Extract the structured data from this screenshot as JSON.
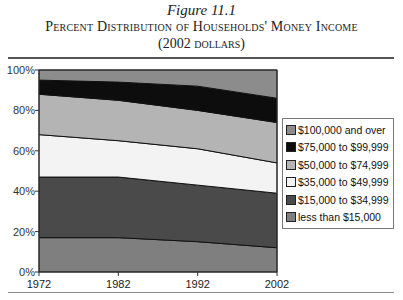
{
  "figure": {
    "number": "Figure 11.1",
    "title": "Percent Distribution of Households' Money Income",
    "subtitle": "(2002 dollars)"
  },
  "chart_data": {
    "type": "area",
    "stacked": true,
    "xlabel": "",
    "ylabel": "",
    "x": [
      1972,
      1982,
      1992,
      2002
    ],
    "x_tick_labels": [
      "1972",
      "1982",
      "1992",
      "2002"
    ],
    "y_tick_labels": [
      "0%",
      "20%",
      "40%",
      "60%",
      "80%",
      "100%"
    ],
    "ylim": [
      0,
      100
    ],
    "grid": false,
    "legend_position": "right",
    "series": [
      {
        "name": "less than $15,000",
        "color": "#7f7f7f",
        "values": [
          17,
          17,
          15,
          12
        ]
      },
      {
        "name": "$15,000 to $34,999",
        "color": "#4a4a4a",
        "values": [
          30,
          30,
          28,
          27
        ]
      },
      {
        "name": "$35,000 to $49,999",
        "color": "#f3f3f3",
        "values": [
          21,
          18,
          18,
          15
        ]
      },
      {
        "name": "$50,000 to $74,999",
        "color": "#b4b4b4",
        "values": [
          20,
          20,
          19,
          20
        ]
      },
      {
        "name": "$75,000 to $99,999",
        "color": "#0d0d0d",
        "values": [
          7,
          9,
          12,
          12
        ]
      },
      {
        "name": "$100,000 and over",
        "color": "#8c8c8c",
        "values": [
          5,
          6,
          8,
          14
        ]
      }
    ]
  },
  "legend": {
    "items": [
      {
        "label": "$100,000 and over",
        "color": "#8c8c8c"
      },
      {
        "label": "$75,000 to $99,999",
        "color": "#0d0d0d"
      },
      {
        "label": "$50,000 to $74,999",
        "color": "#b4b4b4"
      },
      {
        "label": "$35,000 to $49,999",
        "color": "#f3f3f3"
      },
      {
        "label": "$15,000 to $34,999",
        "color": "#4a4a4a"
      },
      {
        "label": "less than $15,000",
        "color": "#7f7f7f"
      }
    ]
  }
}
